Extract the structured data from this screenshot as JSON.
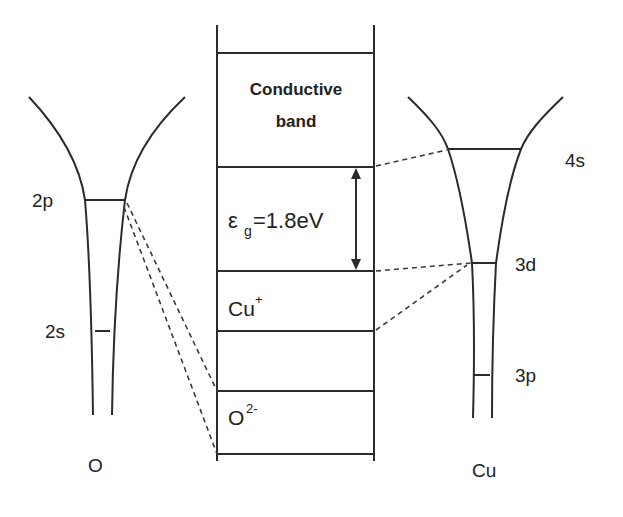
{
  "diagram": {
    "type": "band-structure",
    "colors": {
      "line": "#2b2b2b",
      "text": "#222222",
      "background": "#ffffff"
    },
    "oxygen": {
      "label": "O",
      "levels": [
        {
          "name": "2p",
          "label": "2p"
        },
        {
          "name": "2s",
          "label": "2s"
        }
      ]
    },
    "copper": {
      "label": "Cu",
      "levels": [
        {
          "name": "4s",
          "label": "4s"
        },
        {
          "name": "3d",
          "label": "3d"
        },
        {
          "name": "3p",
          "label": "3p"
        }
      ]
    },
    "bands": {
      "conduction_line1": "Conductive",
      "conduction_line2": "band",
      "gap_symbol": "ε",
      "gap_subscript": "g",
      "gap_value": "=1.8eV",
      "cu_base": "Cu",
      "cu_charge": "+",
      "o_base": "O",
      "o_charge": "2-"
    },
    "connections": [
      {
        "from": "O 2p",
        "to": "O2- band top"
      },
      {
        "from": "O 2p",
        "to": "O2- band bottom"
      },
      {
        "from": "Cu 4s",
        "to": "conduction band bottom"
      },
      {
        "from": "Cu 3d",
        "to": "Cu+ band top"
      },
      {
        "from": "Cu 3d",
        "to": "Cu+ band bottom"
      }
    ]
  }
}
